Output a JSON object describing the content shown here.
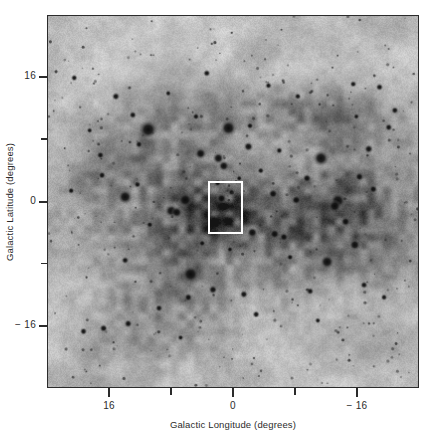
{
  "figure": {
    "domain": "astronomical-sky-map",
    "width": 441,
    "height": 442,
    "background_color": "#ffffff"
  },
  "chart_data": {
    "type": "heatmap",
    "title": "",
    "xlabel": "Galactic Longitude (degrees)",
    "ylabel": "Galactic Latitude (degrees)",
    "xlim": [
      24,
      -24
    ],
    "ylim": [
      -24,
      24
    ],
    "x_ticks": [
      16,
      0,
      -16
    ],
    "x_tick_labels": [
      "16",
      "0",
      "− 16"
    ],
    "x_minor_ticks": [
      8,
      -8
    ],
    "y_ticks": [
      16,
      0,
      -16
    ],
    "y_tick_labels": [
      "16",
      "0",
      "− 16"
    ],
    "y_minor_ticks": [
      8,
      -8
    ],
    "grid": false,
    "legend": "none",
    "colormap": "grayscale-inverted",
    "background_level": 0.68,
    "annotations": [
      {
        "kind": "rectangle",
        "label": "inset-region-outline",
        "color": "#ffffff",
        "x_center": 1.1,
        "y_center": -0.6,
        "width_deg": 4.6,
        "height_deg": 6.8
      }
    ],
    "diffuse_emission": [
      {
        "name": "central-galactic-ridge",
        "l": 0,
        "b": -1,
        "sigma_l": 16,
        "sigma_b": 4,
        "amplitude": 0.3
      },
      {
        "name": "north-dust-filament",
        "l": -6,
        "b": 12,
        "sigma_l": 10,
        "sigma_b": 2.2,
        "amplitude": 0.2
      },
      {
        "name": "upper-left-cloud",
        "l": 11,
        "b": 7,
        "sigma_l": 6,
        "sigma_b": 4,
        "amplitude": 0.2
      },
      {
        "name": "south-dark-lane",
        "l": 6,
        "b": -9,
        "sigma_l": 4,
        "sigma_b": 9,
        "amplitude": 0.22
      },
      {
        "name": "south-east-complex",
        "l": -9,
        "b": -8,
        "sigma_l": 8,
        "sigma_b": 5,
        "amplitude": 0.18
      },
      {
        "name": "lower-left-wisp",
        "l": 13,
        "b": -14,
        "sigma_l": 5,
        "sigma_b": 5,
        "amplitude": 0.15
      },
      {
        "name": "right-equatorial-haze",
        "l": -14,
        "b": -1,
        "sigma_l": 6,
        "sigma_b": 4,
        "amplitude": 0.18
      },
      {
        "name": "upper-right-arc",
        "l": -12,
        "b": 9,
        "sigma_l": 7,
        "sigma_b": 3,
        "amplitude": 0.16
      },
      {
        "name": "box-region-cloud",
        "l": 1,
        "b": -1.5,
        "sigma_l": 2,
        "sigma_b": 1.8,
        "amplitude": 0.25
      }
    ],
    "point_sources": [
      {
        "l": 11.0,
        "b": 9.3,
        "r": 5.2
      },
      {
        "l": 0.6,
        "b": 9.5,
        "r": 4.6
      },
      {
        "l": -11.4,
        "b": 5.6,
        "r": 4.4
      },
      {
        "l": 14.0,
        "b": 0.6,
        "r": 4.0
      },
      {
        "l": 6.2,
        "b": 0.2,
        "r": 4.0
      },
      {
        "l": -13.6,
        "b": 0.1,
        "r": 4.4
      },
      {
        "l": -13.2,
        "b": -0.6,
        "r": 3.6
      },
      {
        "l": 5.5,
        "b": -9.4,
        "r": 4.8
      },
      {
        "l": -12.2,
        "b": -7.8,
        "r": 4.0
      },
      {
        "l": 8.0,
        "b": -1.2,
        "r": 3.6
      },
      {
        "l": 7.3,
        "b": -1.4,
        "r": 3.2
      },
      {
        "l": 1.9,
        "b": 5.6,
        "r": 3.2
      },
      {
        "l": 1.2,
        "b": 4.6,
        "r": 3.0
      },
      {
        "l": 4.2,
        "b": 6.2,
        "r": 3.2
      },
      {
        "l": -2.0,
        "b": 7.1,
        "r": 2.6
      },
      {
        "l": 1.5,
        "b": 0.4,
        "r": 2.8
      },
      {
        "l": -2.5,
        "b": -4.0,
        "r": 3.0
      },
      {
        "l": -5.4,
        "b": -4.2,
        "r": 2.8
      },
      {
        "l": -15.8,
        "b": -5.6,
        "r": 3.2
      },
      {
        "l": -14.6,
        "b": -2.6,
        "r": 2.6
      },
      {
        "l": -8.2,
        "b": 0.2,
        "r": 2.6
      },
      {
        "l": -5.2,
        "b": 1.0,
        "r": 2.6
      },
      {
        "l": -9.6,
        "b": 3.0,
        "r": 2.4
      },
      {
        "l": -16.4,
        "b": 3.2,
        "r": 2.4
      },
      {
        "l": -17.6,
        "b": 6.8,
        "r": 2.4
      },
      {
        "l": -18.2,
        "b": 1.6,
        "r": 2.2
      },
      {
        "l": 15.2,
        "b": 13.6,
        "r": 2.2
      },
      {
        "l": 13.0,
        "b": 11.2,
        "r": 2.0
      },
      {
        "l": 12.2,
        "b": 7.4,
        "r": 2.0
      },
      {
        "l": 17.2,
        "b": 6.0,
        "r": 2.0
      },
      {
        "l": 17.0,
        "b": 3.4,
        "r": 2.0
      },
      {
        "l": 14.0,
        "b": -7.6,
        "r": 2.0
      },
      {
        "l": 13.6,
        "b": -15.8,
        "r": 2.2
      },
      {
        "l": 16.8,
        "b": -16.4,
        "r": 2.2
      },
      {
        "l": 9.6,
        "b": -13.8,
        "r": 2.0
      },
      {
        "l": 5.8,
        "b": -12.4,
        "r": 2.2
      },
      {
        "l": 2.6,
        "b": -11.4,
        "r": 2.4
      },
      {
        "l": -1.4,
        "b": -12.0,
        "r": 2.2
      },
      {
        "l": -3.0,
        "b": -14.6,
        "r": 2.0
      },
      {
        "l": -6.6,
        "b": -4.6,
        "r": 2.4
      },
      {
        "l": -10.0,
        "b": -11.6,
        "r": 2.0
      },
      {
        "l": -17.0,
        "b": -10.8,
        "r": 2.0
      },
      {
        "l": -19.6,
        "b": -12.4,
        "r": 1.8
      },
      {
        "l": -20.2,
        "b": 9.6,
        "r": 2.0
      },
      {
        "l": -21.0,
        "b": 11.8,
        "r": 2.0
      },
      {
        "l": -19.0,
        "b": 14.8,
        "r": 2.0
      },
      {
        "l": -15.6,
        "b": 15.2,
        "r": 1.8
      },
      {
        "l": -8.4,
        "b": 13.6,
        "r": 1.8
      },
      {
        "l": -4.6,
        "b": 15.0,
        "r": 1.8
      },
      {
        "l": 3.4,
        "b": 16.6,
        "r": 2.0
      },
      {
        "l": 20.6,
        "b": 16.0,
        "r": 1.8
      },
      {
        "l": 19.4,
        "b": -16.8,
        "r": 2.0
      },
      {
        "l": 21.0,
        "b": 1.4,
        "r": 1.8
      },
      {
        "l": 2.0,
        "b": 2.4,
        "r": 2.0
      },
      {
        "l": 0.2,
        "b": 1.2,
        "r": 1.8
      },
      {
        "l": -0.8,
        "b": 3.0,
        "r": 1.6
      },
      {
        "l": -3.6,
        "b": 4.0,
        "r": 1.8
      },
      {
        "l": -6.0,
        "b": 6.6,
        "r": 1.8
      },
      {
        "l": -2.2,
        "b": 9.8,
        "r": 1.8
      },
      {
        "l": 4.8,
        "b": 11.0,
        "r": 1.8
      },
      {
        "l": 8.4,
        "b": 14.0,
        "r": 1.6
      },
      {
        "l": 10.8,
        "b": -3.0,
        "r": 1.8
      },
      {
        "l": 4.0,
        "b": -5.4,
        "r": 1.8
      },
      {
        "l": -7.4,
        "b": -7.2,
        "r": 1.8
      },
      {
        "l": -11.0,
        "b": -15.4,
        "r": 1.6
      },
      {
        "l": 6.8,
        "b": -17.6,
        "r": 1.6
      },
      {
        "l": 0.4,
        "b": -6.2,
        "r": 1.6
      },
      {
        "l": -16.0,
        "b": 11.0,
        "r": 1.6
      },
      {
        "l": 18.6,
        "b": 9.2,
        "r": 1.6
      },
      {
        "l": 12.4,
        "b": 2.2,
        "r": 1.8
      }
    ]
  },
  "axes": {
    "x_title": "Galactic Longitude (degrees)",
    "y_title": "Galactic Latitude (degrees)",
    "x_tick_labels": [
      "16",
      "0",
      "− 16"
    ],
    "y_tick_labels": [
      "16",
      "0",
      "− 16"
    ]
  },
  "colors": {
    "frame": "#2b2b2b",
    "text": "#2b2b2b",
    "highlight_box": "#ffffff",
    "sky_background": "#b4b4b4"
  }
}
